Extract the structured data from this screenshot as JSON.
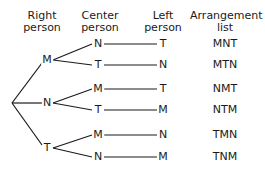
{
  "headers": {
    "right": [
      "Right",
      "person"
    ],
    "center": [
      "Center",
      "person"
    ],
    "left": [
      "Left",
      "person"
    ],
    "list": [
      "Arrangement",
      "list"
    ]
  },
  "tree": {
    "right": [
      "M",
      "N",
      "T"
    ],
    "center": [
      "N",
      "T",
      "M",
      "T",
      "M",
      "N"
    ],
    "left": [
      "T",
      "N",
      "T",
      "M",
      "N",
      "M"
    ],
    "list": [
      "MNT",
      "MTN",
      "NMT",
      "NTM",
      "TMN",
      "TNM"
    ]
  }
}
